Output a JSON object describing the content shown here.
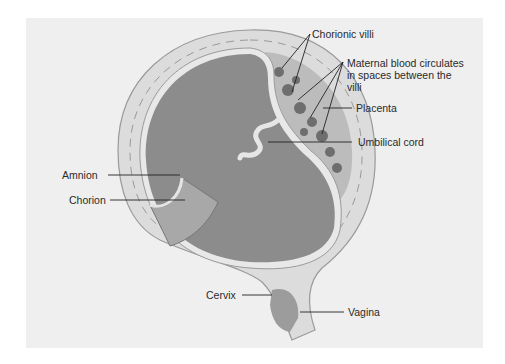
{
  "figure": {
    "type": "anatomical-diagram",
    "colors": {
      "background": "#ffffff",
      "panel": "#efefef",
      "uterine_wall": "#d9d9d9",
      "wall_outline": "#9a9a9a",
      "amniotic_cavity": "#8c8c8c",
      "placenta": "#b9b9b9",
      "villi": "#6e6e6e",
      "cord": "#e6e6e6",
      "leader_line": "#222222",
      "text": "#2a2a2a"
    },
    "labels": {
      "chorionic_villi": "Chorionic villi",
      "maternal_blood": "Maternal blood circulates in spaces between the villi",
      "placenta": "Placenta",
      "umbilical_cord": "Umbilical cord",
      "amnion": "Amnion",
      "chorion": "Chorion",
      "cervix": "Cervix",
      "vagina": "Vagina"
    }
  }
}
